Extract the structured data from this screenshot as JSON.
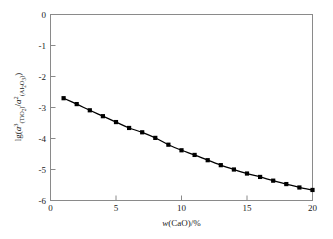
{
  "chart_data": {
    "type": "line",
    "title": "",
    "subtitle": "",
    "xlabel_parts": {
      "var": "w",
      "paren_open": "(",
      "species": "CaO",
      "paren_close": ")",
      "per_percent": "/%"
    },
    "xlabel": "w(CaO)/%",
    "ylabel_parts": {
      "lg": "lg",
      "paren_open": "(",
      "a1": "a",
      "a1_sup": "3",
      "a1_sub_open": "(",
      "a1_sub": "TiO",
      "a1_sub_num": "2",
      "a1_sub_close": ")",
      "slash": "/",
      "a2": "a",
      "a2_sup": "2",
      "a2_sub_open": "(",
      "a2_sub_al": "Al",
      "a2_sub_al_num": "2",
      "a2_sub_o": "O",
      "a2_sub_o_num": "3",
      "a2_sub_close": ")",
      "paren_close": ")"
    },
    "ylabel": "lg(a3(TiO2)/a2(Al2O3))",
    "xlim": [
      0,
      20
    ],
    "ylim": [
      -6,
      0
    ],
    "xticks": [
      0,
      5,
      10,
      15,
      20
    ],
    "xticklabels": [
      "0",
      "5",
      "10",
      "15",
      "20"
    ],
    "yticks": [
      0,
      -1,
      -2,
      -3,
      -4,
      -5,
      -6
    ],
    "yticklabels": [
      "0",
      "-1",
      "-2",
      "-3",
      "-4",
      "-5",
      "-6"
    ],
    "grid": false,
    "legend": null,
    "marker": "square",
    "marker_color": "#000000",
    "line_color": "#000000",
    "frame_color": "#8a8a8a",
    "series": [
      {
        "name": "lg(a3(TiO2)/a2(Al2O3)) vs w(CaO)",
        "x": [
          1,
          2,
          3,
          4,
          5,
          6,
          7,
          8,
          9,
          10,
          11,
          12,
          13,
          14,
          15,
          16,
          17,
          18,
          19,
          20
        ],
        "values": [
          -2.7,
          -2.89,
          -3.09,
          -3.28,
          -3.47,
          -3.66,
          -3.8,
          -3.98,
          -4.2,
          -4.38,
          -4.53,
          -4.7,
          -4.86,
          -5.0,
          -5.13,
          -5.24,
          -5.36,
          -5.47,
          -5.58,
          -5.66
        ]
      }
    ]
  }
}
